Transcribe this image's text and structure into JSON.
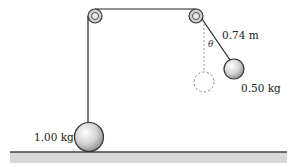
{
  "diagram": {
    "type": "pulley-pendulum",
    "labels": {
      "length": "0.74 m",
      "angle": "θ",
      "small_mass": "0.50 kg",
      "large_mass": "1.00 kg"
    },
    "colors": {
      "line": "#222222",
      "floor_fill": "#d8d8d8",
      "pulley_fill": "#cfcfcf",
      "dashed": "#888888"
    }
  }
}
